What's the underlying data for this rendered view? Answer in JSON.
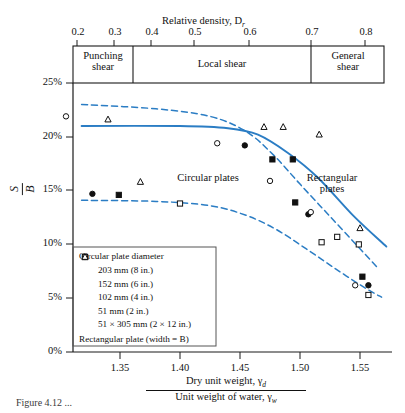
{
  "figure": {
    "top_axis_title": "Relative density, D",
    "top_axis_title_sub": "r",
    "y_axis_label_num": "S",
    "y_axis_label_den": "B",
    "bottom_axis_num": "Dry unit weight, γ",
    "bottom_axis_num_sub": "d",
    "bottom_axis_den": "Unit weight of water, γ",
    "bottom_axis_den_sub": "w",
    "caption": "Figure 4.12  ...",
    "accent_color": "#2b7dc4",
    "axis_color": "#1a1a1a"
  },
  "zones": [
    {
      "name": "punching-shear",
      "label_line1": "Punching",
      "label_line2": "shear",
      "from": 0.2,
      "to": 0.35
    },
    {
      "name": "local-shear",
      "label_line1": "Local shear",
      "label_line2": "",
      "from": 0.35,
      "to": 0.7
    },
    {
      "name": "general-shear",
      "label_line1": "General",
      "label_line2": "shear",
      "from": 0.7,
      "to": 0.85
    }
  ],
  "annotations": [
    {
      "name": "rectangular-plates-label",
      "line1": "Rectangular",
      "line2": "plates",
      "x": 330,
      "y": 182
    },
    {
      "name": "circular-plates-label",
      "line1": "Circular plates",
      "line2": "",
      "x": 208,
      "y": 179
    }
  ],
  "legend": {
    "title": "Circular plate diameter",
    "footer": "Rectangular plate (width = B)",
    "items": [
      {
        "marker": "filled-square",
        "label": "203 mm (8 in.)"
      },
      {
        "marker": "open-square",
        "label": "152 mm (6 in.)"
      },
      {
        "marker": "filled-circle",
        "label": "102 mm (4 in.)"
      },
      {
        "marker": "open-circle",
        "label": "51 mm (2 in.)"
      },
      {
        "marker": "open-triangle",
        "label": "51 × 305 mm (2 × 12 in.)"
      }
    ]
  },
  "chart_data": {
    "type": "scatter",
    "title": "",
    "xlabel": "Dry unit weight, γd / Unit weight of water, γw",
    "ylabel": "S/B",
    "xlim": [
      1.315,
      1.585
    ],
    "ylim": [
      0,
      0.25
    ],
    "grid": false,
    "legend_position": "inside-bottom-left",
    "x_ticks_bottom": [
      "1.35",
      "1.40",
      "1.45",
      "1.50",
      "1.55"
    ],
    "x_ticks_bottom_values": [
      1.35,
      1.4,
      1.45,
      1.5,
      1.55
    ],
    "x_ticks_top": [
      "0.2",
      "0.3",
      "0.4",
      "0.5",
      "0.6",
      "0.7",
      "0.8"
    ],
    "x_ticks_top_values": [
      0.2,
      0.3,
      0.4,
      0.5,
      0.6,
      0.7,
      0.8
    ],
    "y_ticks": [
      "0%",
      "5%",
      "10%",
      "15%",
      "20%",
      "25%"
    ],
    "y_ticks_values": [
      0,
      5,
      10,
      15,
      20,
      25
    ],
    "series": [
      {
        "name": "203 mm (8 in.)",
        "marker": "filled-square",
        "points": [
          [
            1.349,
            14.6
          ],
          [
            1.477,
            17.9
          ],
          [
            1.494,
            17.9
          ],
          [
            1.496,
            13.9
          ],
          [
            1.552,
            7.0
          ]
        ]
      },
      {
        "name": "152 mm (6 in.)",
        "marker": "open-square",
        "points": [
          [
            1.4,
            13.8
          ],
          [
            1.518,
            10.2
          ],
          [
            1.531,
            10.7
          ],
          [
            1.549,
            10.0
          ],
          [
            1.557,
            5.3
          ]
        ]
      },
      {
        "name": "102 mm (4 in.)",
        "marker": "filled-circle",
        "points": [
          [
            1.327,
            14.7
          ],
          [
            1.454,
            19.2
          ],
          [
            1.507,
            12.8
          ],
          [
            1.557,
            6.2
          ]
        ]
      },
      {
        "name": "51 mm (2 in.)",
        "marker": "open-circle",
        "points": [
          [
            1.305,
            21.9
          ],
          [
            1.431,
            19.4
          ],
          [
            1.475,
            15.9
          ],
          [
            1.509,
            13.0
          ],
          [
            1.546,
            6.2
          ]
        ]
      },
      {
        "name": "51 × 305 mm (2 × 12 in.)",
        "marker": "open-triangle",
        "points": [
          [
            1.34,
            21.6
          ],
          [
            1.367,
            15.8
          ],
          [
            1.47,
            20.9
          ],
          [
            1.486,
            20.9
          ],
          [
            1.516,
            20.2
          ],
          [
            1.55,
            11.5
          ]
        ]
      }
    ],
    "curves": [
      {
        "name": "rectangular-plates-solid",
        "style": "solid",
        "color": "#2b7dc4",
        "points": [
          [
            1.318,
            21.0
          ],
          [
            1.4,
            21.0
          ],
          [
            1.44,
            20.8
          ],
          [
            1.465,
            20.2
          ],
          [
            1.49,
            18.5
          ],
          [
            1.515,
            16.2
          ],
          [
            1.545,
            12.6
          ],
          [
            1.572,
            9.8
          ]
        ]
      },
      {
        "name": "upper-band-dashed",
        "style": "dashed",
        "color": "#2b7dc4",
        "points": [
          [
            1.318,
            23.0
          ],
          [
            1.38,
            22.6
          ],
          [
            1.425,
            21.9
          ],
          [
            1.455,
            20.5
          ],
          [
            1.478,
            18.3
          ],
          [
            1.5,
            15.6
          ],
          [
            1.525,
            12.6
          ],
          [
            1.55,
            9.6
          ],
          [
            1.565,
            7.8
          ]
        ]
      },
      {
        "name": "lower-band-dashed",
        "style": "dashed",
        "color": "#2b7dc4",
        "points": [
          [
            1.318,
            14.1
          ],
          [
            1.38,
            14.0
          ],
          [
            1.425,
            13.6
          ],
          [
            1.455,
            12.7
          ],
          [
            1.48,
            11.4
          ],
          [
            1.505,
            9.6
          ],
          [
            1.53,
            7.7
          ],
          [
            1.555,
            5.9
          ],
          [
            1.568,
            5.1
          ]
        ]
      }
    ]
  }
}
